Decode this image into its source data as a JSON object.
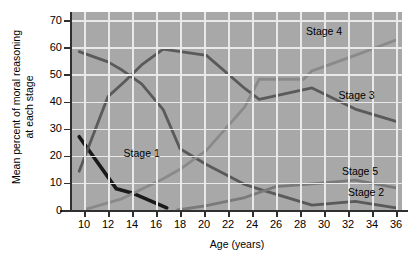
{
  "chart_data": {
    "type": "line",
    "title": "",
    "xlabel": "Age (years)",
    "ylabel": "Mean percent of moral reasoning at each stage",
    "ylabel_line1": "Mean percent of moral reasoning",
    "ylabel_line2": "at each stage",
    "xlim": [
      9,
      36.5
    ],
    "ylim": [
      0,
      73
    ],
    "xticks": [
      10,
      12,
      14,
      16,
      18,
      20,
      22,
      24,
      26,
      28,
      30,
      32,
      34,
      36
    ],
    "yticks": [
      0,
      10,
      20,
      30,
      40,
      50,
      60,
      70
    ],
    "grid": true,
    "legend_position": "inline-annotations",
    "plot_background": "#a8a8a8",
    "gridline_color": "#e9e9e9",
    "series": [
      {
        "name": "Stage 1",
        "color": "#1a1a1a",
        "label_x": 13.3,
        "label_y": 20.5,
        "x": [
          9.6,
          12.7,
          14.0,
          16.9
        ],
        "values": [
          27.0,
          7.8,
          6.3,
          0.8
        ]
      },
      {
        "name": "Stage 2",
        "color": "#5a5a5a",
        "label_x": 32.0,
        "label_y": 6.2,
        "x": [
          9.6,
          12.0,
          13.2,
          14.8,
          16.6,
          18.0,
          20.2,
          23.4,
          24.6,
          29.0,
          32.6,
          36.0
        ],
        "values": [
          58.4,
          54.6,
          51.5,
          46.5,
          37.0,
          22.6,
          16.8,
          9.4,
          7.7,
          1.8,
          3.2,
          0.8
        ]
      },
      {
        "name": "Stage 3",
        "color": "#5a5a5a",
        "label_x": 31.2,
        "label_y": 42.0,
        "x": [
          9.6,
          12.0,
          13.3,
          14.8,
          16.6,
          20.2,
          23.4,
          24.6,
          29.0,
          32.6,
          36.0
        ],
        "values": [
          14.3,
          41.8,
          47.0,
          53.5,
          59.3,
          57.0,
          44.8,
          40.8,
          45.0,
          37.2,
          32.7
        ]
      },
      {
        "name": "Stage 4",
        "color": "#8a8a8a",
        "label_x": 28.5,
        "label_y": 65.5,
        "x": [
          10.2,
          13.2,
          16.6,
          18.0,
          20.2,
          23.4,
          24.6,
          28.3,
          29.0,
          32.6,
          36.0
        ],
        "values": [
          0.3,
          4.2,
          11.5,
          15.0,
          22.0,
          38.0,
          48.2,
          48.2,
          51.3,
          57.0,
          62.7
        ]
      },
      {
        "name": "Stage 5",
        "color": "#7a7a7a",
        "label_x": 31.5,
        "label_y": 14.0,
        "x": [
          17.8,
          20.2,
          23.4,
          26.0,
          29.0,
          32.6,
          36.0
        ],
        "values": [
          0.0,
          1.6,
          4.6,
          8.6,
          9.6,
          11.0,
          8.2
        ]
      }
    ]
  }
}
